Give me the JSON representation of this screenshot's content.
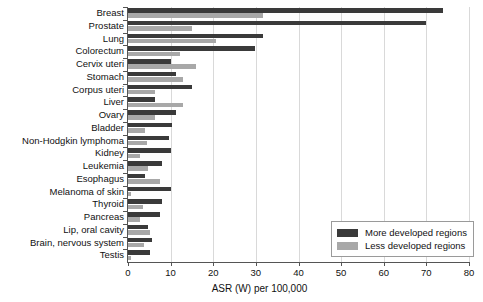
{
  "chart_data": {
    "type": "bar",
    "orientation": "horizontal",
    "title": "",
    "xlabel": "ASR (W) per 100,000",
    "ylabel": "",
    "xlim": [
      0,
      80
    ],
    "xticks": [
      0,
      10,
      20,
      30,
      40,
      50,
      60,
      70,
      80
    ],
    "grid": true,
    "legend_position": "bottom-right",
    "categories": [
      "Breast",
      "Prostate",
      "Lung",
      "Colorectum",
      "Cervix uteri",
      "Stomach",
      "Corpus uteri",
      "Liver",
      "Ovary",
      "Bladder",
      "Non-Hodgkin lymphoma",
      "Kidney",
      "Leukemia",
      "Esophagus",
      "Melanoma of skin",
      "Thyroid",
      "Pancreas",
      "Lip, oral cavity",
      "Brain, nervous system",
      "Testis"
    ],
    "series": [
      {
        "name": "More developed regions",
        "color": "#3a3a3a",
        "values": [
          74.0,
          70.0,
          31.7,
          29.8,
          10.0,
          11.3,
          15.0,
          6.3,
          11.3,
          10.3,
          9.6,
          10.0,
          8.0,
          4.0,
          10.0,
          8.0,
          7.5,
          4.7,
          5.6,
          5.2
        ]
      },
      {
        "name": "Less developed regions",
        "color": "#a8a8a8",
        "values": [
          31.7,
          15.0,
          20.6,
          12.2,
          16.0,
          13.0,
          6.3,
          13.0,
          6.3,
          4.0,
          4.5,
          2.8,
          4.7,
          7.5,
          0.7,
          3.5,
          2.8,
          5.2,
          3.8,
          0.7
        ]
      }
    ]
  },
  "legend": {
    "items": [
      {
        "label": "More developed regions",
        "color": "#3a3a3a"
      },
      {
        "label": "Less developed regions",
        "color": "#a8a8a8"
      }
    ]
  },
  "axis": {
    "x_title": "ASR (W) per 100,000",
    "tick_labels": [
      "0",
      "10",
      "20",
      "30",
      "40",
      "50",
      "60",
      "70",
      "80"
    ]
  }
}
